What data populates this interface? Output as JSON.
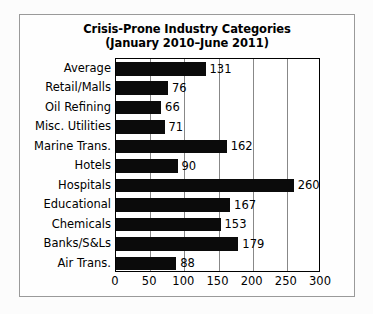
{
  "chart_data": {
    "type": "bar",
    "orientation": "horizontal",
    "title": "Crisis-Prone Industry Categories",
    "subtitle": "(January 2010–June 2011)",
    "xlabel": "",
    "ylabel": "",
    "xlim": [
      0,
      300
    ],
    "xticks": [
      "0",
      "50",
      "100",
      "150",
      "200",
      "250",
      "300"
    ],
    "xtick_values": [
      0,
      50,
      100,
      150,
      200,
      250,
      300
    ],
    "grid": "vertical",
    "legend": "none",
    "bar_color": "#0b0b0b",
    "categories": [
      "Average",
      "Retail/Malls",
      "Oil Refining",
      "Misc. Utilities",
      "Marine Trans.",
      "Hotels",
      "Hospitals",
      "Educational",
      "Chemicals",
      "Banks/S&Ls",
      "Air Trans."
    ],
    "values": [
      131,
      76,
      66,
      71,
      162,
      90,
      260,
      167,
      153,
      179,
      88
    ],
    "value_labels": [
      "131",
      "76",
      "66",
      "71",
      "162",
      "90",
      "260",
      "167",
      "153",
      "179",
      "88"
    ],
    "bars": [
      {
        "category": "Average",
        "value": 131,
        "label": "131"
      },
      {
        "category": "Retail/Malls",
        "value": 76,
        "label": "76"
      },
      {
        "category": "Oil Refining",
        "value": 66,
        "label": "66"
      },
      {
        "category": "Misc. Utilities",
        "value": 71,
        "label": "71"
      },
      {
        "category": "Marine Trans.",
        "value": 162,
        "label": "162"
      },
      {
        "category": "Hotels",
        "value": 90,
        "label": "90"
      },
      {
        "category": "Hospitals",
        "value": 260,
        "label": "260"
      },
      {
        "category": "Educational",
        "value": 167,
        "label": "167"
      },
      {
        "category": "Chemicals",
        "value": 153,
        "label": "153"
      },
      {
        "category": "Banks/S&Ls",
        "value": 179,
        "label": "179"
      },
      {
        "category": "Air Trans.",
        "value": 88,
        "label": "88"
      }
    ]
  }
}
